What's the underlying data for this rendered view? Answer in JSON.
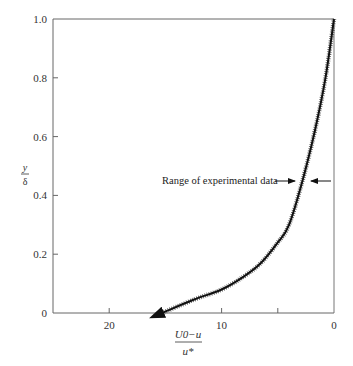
{
  "chart_data": {
    "type": "line",
    "title": "",
    "xlabel": "(U0 - u) / u*",
    "xlabel_num": "U0−u",
    "xlabel_den": "u*",
    "ylabel": "y / δ",
    "ylabel_num": "y",
    "ylabel_den": "δ",
    "xlim": [
      25,
      0
    ],
    "ylim": [
      0,
      1.0
    ],
    "x_reversed": true,
    "x_ticks": [
      20,
      10,
      5,
      0
    ],
    "x_tick_labels": [
      "20",
      "10",
      "",
      "0"
    ],
    "y_ticks": [
      0,
      0.2,
      0.4,
      0.6,
      0.8,
      1.0
    ],
    "y_tick_labels": [
      "0",
      "0.2",
      "0.4",
      "0.6",
      "0.8",
      "1.0"
    ],
    "grid": false,
    "legend": null,
    "series": [
      {
        "name": "Velocity defect law (with range of experimental data band)",
        "x": [
          15.3,
          12.5,
          10.0,
          8.0,
          6.5,
          5.0,
          4.0,
          2.8,
          1.7,
          0.8,
          0.0
        ],
        "y": [
          0.0,
          0.045,
          0.08,
          0.125,
          0.17,
          0.24,
          0.3,
          0.45,
          0.62,
          0.79,
          1.0
        ]
      }
    ],
    "annotations": [
      {
        "text": "Range of experimental data",
        "x": 2.8,
        "y": 0.45,
        "type": "double-arrow-band"
      }
    ]
  }
}
